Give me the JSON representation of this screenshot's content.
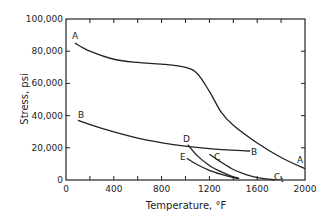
{
  "chart_data": {
    "type": "line",
    "title": "",
    "xlabel": "Temperature, °F",
    "ylabel": "Stress, psi",
    "xlim": [
      0,
      2000
    ],
    "ylim": [
      0,
      100000
    ],
    "x_ticks": [
      0,
      400,
      800,
      1200,
      1600,
      2000
    ],
    "x_tick_labels": [
      "0",
      "400",
      "800",
      "1200",
      "1600",
      "2000"
    ],
    "y_ticks": [
      0,
      20000,
      40000,
      60000,
      80000,
      100000
    ],
    "y_tick_labels": [
      "0",
      "20,000",
      "40,000",
      "60,000",
      "80,000",
      "100,000"
    ],
    "grid": false,
    "legend": "inline curve labels",
    "series": [
      {
        "name": "A",
        "x": [
          75,
          200,
          400,
          600,
          800,
          1000,
          1100,
          1200,
          1300,
          1400,
          1600,
          1800,
          2000
        ],
        "values": [
          85000,
          80000,
          75000,
          73000,
          72000,
          70000,
          66000,
          55000,
          42000,
          34000,
          23000,
          14000,
          7000
        ]
      },
      {
        "name": "B",
        "x": [
          100,
          300,
          600,
          900,
          1200,
          1540
        ],
        "values": [
          37000,
          32000,
          26000,
          22000,
          19500,
          18000
        ]
      },
      {
        "name": "C",
        "x": [
          1200,
          1300,
          1400,
          1500,
          1600,
          1700,
          1750
        ],
        "values": [
          16000,
          11000,
          6500,
          3500,
          1500,
          500,
          0
        ]
      },
      {
        "name": "D",
        "x": [
          1020,
          1100,
          1200,
          1300,
          1400,
          1440
        ],
        "values": [
          22000,
          15000,
          9000,
          5000,
          2000,
          1500
        ]
      },
      {
        "name": "E",
        "x": [
          1010,
          1100,
          1200,
          1300,
          1400,
          1450
        ],
        "values": [
          13500,
          9500,
          6000,
          3500,
          1500,
          1000
        ]
      }
    ],
    "annotations": [
      "A",
      "B",
      "C",
      "C1",
      "D",
      "E"
    ]
  },
  "labels": {
    "ylabel": "Stress, psi",
    "xlabel": "Temperature, °F",
    "curve_A_start": "A",
    "curve_A_end": "A",
    "curve_B_start": "B",
    "curve_B_end": "B",
    "curve_C": "C",
    "curve_C1": "C",
    "curve_C1_sub": "1",
    "curve_D": "D",
    "curve_E": "E"
  }
}
